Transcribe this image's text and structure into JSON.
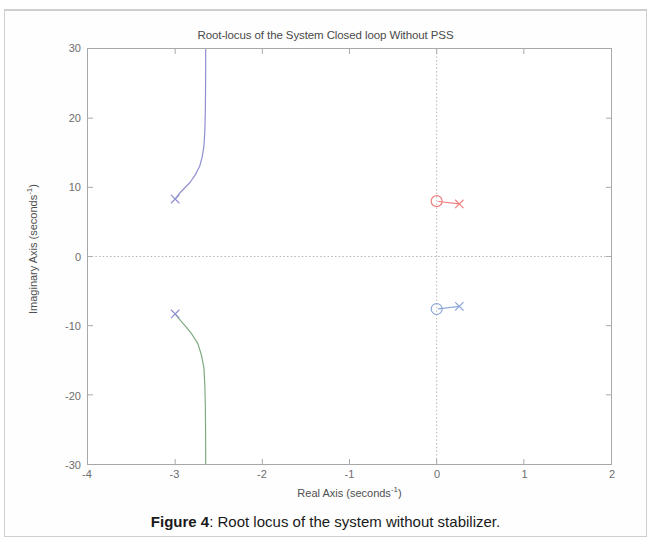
{
  "figure": {
    "caption_bold": "Figure 4",
    "caption_rest": ": Root locus of the system without stabilizer."
  },
  "chart_data": {
    "type": "scatter",
    "title": "Root-locus of the System Closed loop Without PSS",
    "xlabel_main": "Real Axis (seconds",
    "xlabel_exp": "-1",
    "xlabel_tail": ")",
    "ylabel_main": "Imaginary Axis (seconds",
    "ylabel_exp": "-1",
    "ylabel_tail": ")",
    "xlim": [
      -4,
      2
    ],
    "ylim": [
      -30,
      30
    ],
    "xticks": [
      -4,
      -3,
      -2,
      -1,
      0,
      1,
      2
    ],
    "xtick_labels": [
      "-4",
      "-3",
      "-2",
      "-1",
      "0",
      "1",
      "2"
    ],
    "yticks": [
      -30,
      -20,
      -10,
      0,
      10,
      20,
      30
    ],
    "ytick_labels": [
      "-30",
      "-20",
      "-10",
      "0",
      "10",
      "20",
      "30"
    ],
    "grid": false,
    "crosshair_x": 0,
    "crosshair_y": 0,
    "legend": null,
    "colors": {
      "branch_upper_left": "#8f8fd0",
      "branch_lower_left": "#7faa7f",
      "branch_upper_right": "#f08080",
      "branch_lower_right": "#8fa8d8",
      "axis": "#a8a8a8",
      "crosshair": "#b5b5b5",
      "text": "#4f4f4f"
    },
    "poles": [
      {
        "name": "pole-upper-left",
        "x": -3.0,
        "y": 8.3,
        "marker": "x",
        "color": "#8f8fd0"
      },
      {
        "name": "pole-lower-left",
        "x": -3.0,
        "y": -8.3,
        "marker": "x",
        "color": "#8f8fd0"
      },
      {
        "name": "pole-upper-right",
        "x": 0.26,
        "y": 7.6,
        "marker": "x",
        "color": "#f08080"
      },
      {
        "name": "pole-lower-right",
        "x": 0.26,
        "y": -7.2,
        "marker": "x",
        "color": "#8fa8d8"
      }
    ],
    "zeros": [
      {
        "name": "zero-upper",
        "x": 0.0,
        "y": 8.0,
        "marker": "o",
        "color": "#f08080"
      },
      {
        "name": "zero-lower",
        "x": 0.0,
        "y": -7.6,
        "marker": "o",
        "color": "#8fa8d8"
      }
    ],
    "branches": [
      {
        "name": "branch-upper-left",
        "color": "#8f8fd0",
        "points": [
          [
            -3.0,
            8.3
          ],
          [
            -2.96,
            9.0
          ],
          [
            -2.9,
            9.8
          ],
          [
            -2.83,
            10.7
          ],
          [
            -2.77,
            11.8
          ],
          [
            -2.72,
            13.0
          ],
          [
            -2.69,
            14.4
          ],
          [
            -2.67,
            16.0
          ],
          [
            -2.66,
            18.0
          ],
          [
            -2.655,
            20.5
          ],
          [
            -2.652,
            23.5
          ],
          [
            -2.65,
            27.0
          ],
          [
            -2.65,
            30.0
          ]
        ]
      },
      {
        "name": "branch-lower-left",
        "color": "#7faa7f",
        "points": [
          [
            -3.0,
            -8.3
          ],
          [
            -2.95,
            -9.1
          ],
          [
            -2.88,
            -10.1
          ],
          [
            -2.81,
            -11.2
          ],
          [
            -2.74,
            -12.6
          ],
          [
            -2.7,
            -14.2
          ],
          [
            -2.67,
            -16.1
          ],
          [
            -2.66,
            -18.5
          ],
          [
            -2.654,
            -21.5
          ],
          [
            -2.651,
            -25.0
          ],
          [
            -2.65,
            -28.0
          ],
          [
            -2.65,
            -30.0
          ]
        ]
      },
      {
        "name": "branch-upper-right",
        "color": "#f08080",
        "points": [
          [
            0.02,
            7.95
          ],
          [
            0.26,
            7.62
          ]
        ]
      },
      {
        "name": "branch-lower-right",
        "color": "#8fa8d8",
        "points": [
          [
            0.02,
            -7.58
          ],
          [
            0.26,
            -7.22
          ]
        ]
      }
    ]
  }
}
